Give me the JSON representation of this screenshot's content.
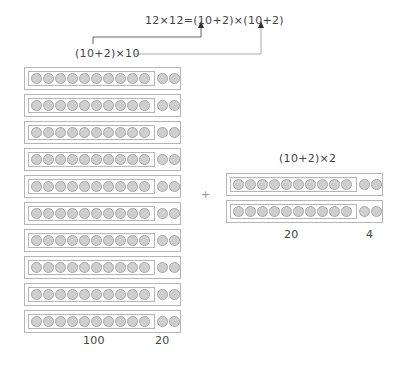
{
  "equation": "12×12=(10+2)×(10+2)",
  "left_label": "(10+2)×10",
  "right_label": "(10+2)×2",
  "plus": "+",
  "left_group": {
    "rows": 10,
    "dots_per_inner": 10,
    "dots_tail": 2,
    "sum_labels": [
      "100",
      "20"
    ]
  },
  "right_group": {
    "rows": 2,
    "dots_per_inner": 10,
    "dots_tail": 2,
    "sum_labels": [
      "20",
      "4"
    ]
  },
  "colors": {
    "dot_fill": "#cfcfcf",
    "dot_stroke": "#a9a9a9",
    "box_stroke": "#b5b5b5",
    "text": "#444444"
  }
}
